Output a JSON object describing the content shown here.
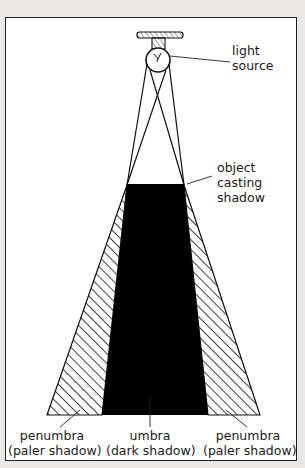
{
  "diagram": {
    "colors": {
      "background": "#e9e8e6",
      "panel": "#ffffff",
      "ink": "#1a1a1a",
      "umbra": "#000000"
    },
    "labels": {
      "light_source": {
        "line1": "light",
        "line2": "source"
      },
      "object": {
        "line1": "object",
        "line2": "casting",
        "line3": "shadow"
      },
      "penumbra_left": {
        "line1": "penumbra",
        "line2": "(paler shadow)"
      },
      "umbra": {
        "line1": "umbra",
        "line2": "(dark shadow)"
      },
      "penumbra_right": {
        "line1": "penumbra",
        "line2": "(paler shadow)"
      }
    },
    "icons": {
      "lamp": "light-bulb-icon",
      "object": "object-block"
    }
  }
}
